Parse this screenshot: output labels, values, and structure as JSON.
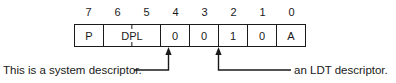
{
  "diagram": {
    "bit_numbers": [
      "7",
      "6",
      "5",
      "4",
      "3",
      "2",
      "1",
      "0"
    ],
    "fields": [
      {
        "label": "P",
        "bits": 1,
        "tick": false
      },
      {
        "label": "DPL",
        "bits": 2,
        "tick": true
      },
      {
        "label": "0",
        "bits": 1,
        "tick": false
      },
      {
        "label": "0",
        "bits": 1,
        "tick": false
      },
      {
        "label": "1",
        "bits": 1,
        "tick": false
      },
      {
        "label": "0",
        "bits": 1,
        "tick": false
      },
      {
        "label": "A",
        "bits": 1,
        "tick": false
      }
    ],
    "annotations": [
      {
        "text": "This is a system descriptor.",
        "points_to_bit": "4"
      },
      {
        "text": "an LDT descriptor.",
        "points_to_bit": "2"
      }
    ],
    "colors": {
      "ink": "#1a1a1a",
      "background": "#ffffff"
    }
  }
}
